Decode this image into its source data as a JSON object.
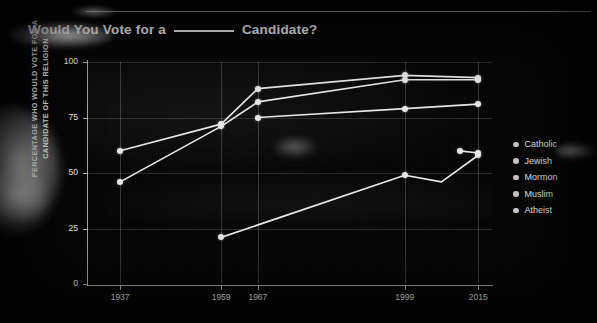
{
  "chart_data": {
    "type": "line",
    "title_prefix": "Would You Vote for a",
    "title_suffix": "Candidate?",
    "xlabel": "",
    "ylabel": "PERCENTAGE WHO WOULD VOTE FOR A CANDIDATE OF THIS RELIGION",
    "ylim": [
      0,
      100
    ],
    "yticks": [
      0,
      25,
      50,
      75,
      100
    ],
    "xticks": [
      "1937",
      "1959",
      "1967",
      "1999",
      "2015"
    ],
    "x": [
      1937,
      1959,
      1967,
      1999,
      2015
    ],
    "xlim": [
      1930,
      2018
    ],
    "grid": true,
    "legend_position": "right",
    "series": [
      {
        "name": "Catholic",
        "color": "#e6e6e6",
        "points": [
          {
            "x": 1937,
            "y": 60
          },
          {
            "x": 1959,
            "y": 72
          },
          {
            "x": 1967,
            "y": 88
          },
          {
            "x": 1999,
            "y": 94
          },
          {
            "x": 2015,
            "y": 93
          }
        ]
      },
      {
        "name": "Jewish",
        "color": "#e6e6e6",
        "points": [
          {
            "x": 1937,
            "y": 46
          },
          {
            "x": 1959,
            "y": 71
          },
          {
            "x": 1967,
            "y": 82
          },
          {
            "x": 1999,
            "y": 92
          },
          {
            "x": 2015,
            "y": 92
          }
        ]
      },
      {
        "name": "Mormon",
        "color": "#e6e6e6",
        "points": [
          {
            "x": 1967,
            "y": 75
          },
          {
            "x": 1999,
            "y": 79
          },
          {
            "x": 2015,
            "y": 81
          }
        ]
      },
      {
        "name": "Muslim",
        "color": "#e6e6e6",
        "points": [
          {
            "x": 2011,
            "y": 60
          },
          {
            "x": 2015,
            "y": 59
          }
        ]
      },
      {
        "name": "Atheist",
        "color": "#e6e6e6",
        "points": [
          {
            "x": 1959,
            "y": 21
          },
          {
            "x": 1999,
            "y": 49
          },
          {
            "x": 2007,
            "y": 46
          },
          {
            "x": 2015,
            "y": 58
          }
        ]
      }
    ]
  },
  "legend": {
    "items": [
      {
        "label": "Catholic"
      },
      {
        "label": "Jewish"
      },
      {
        "label": "Mormon"
      },
      {
        "label": "Muslim"
      },
      {
        "label": "Atheist"
      }
    ]
  }
}
